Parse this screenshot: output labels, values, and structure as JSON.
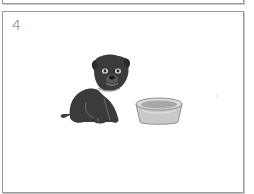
{
  "previous_panel": {
    "visible": "bottom-edge-only"
  },
  "panel": {
    "number": "4",
    "illustration": {
      "subject": "puppy sitting next to a food bowl",
      "elements": [
        "puppy-icon",
        "food-bowl-icon"
      ]
    }
  },
  "colors": {
    "border": "#9a9a9a",
    "number_text": "#6a6a6a",
    "puppy": "#3b3b3b",
    "bowl": "#b8b8b8"
  }
}
